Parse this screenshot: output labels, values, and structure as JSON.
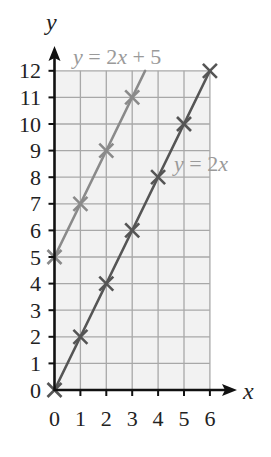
{
  "chart_data": {
    "type": "line",
    "title": "",
    "xlabel": "x",
    "ylabel": "y",
    "xlim": [
      0,
      6
    ],
    "ylim": [
      0,
      12
    ],
    "grid": true,
    "x_ticks": [
      0,
      1,
      2,
      3,
      4,
      5,
      6
    ],
    "y_ticks": [
      0,
      1,
      2,
      3,
      4,
      5,
      6,
      7,
      8,
      9,
      10,
      11,
      12
    ],
    "series": [
      {
        "name": "y = 2x + 5",
        "equation": "y = 2x + 5",
        "color": "#8a8a8a",
        "marker": "x",
        "points": [
          [
            0,
            5
          ],
          [
            1,
            7
          ],
          [
            2,
            9
          ],
          [
            3,
            11
          ]
        ],
        "line_extent": [
          [
            0,
            5
          ],
          [
            3.5,
            12
          ]
        ]
      },
      {
        "name": "y = 2x",
        "equation": "y = 2x",
        "color": "#555555",
        "marker": "x",
        "points": [
          [
            0,
            0
          ],
          [
            1,
            2
          ],
          [
            2,
            4
          ],
          [
            3,
            6
          ],
          [
            4,
            8
          ],
          [
            5,
            10
          ],
          [
            6,
            12
          ]
        ],
        "line_extent": [
          [
            0,
            0
          ],
          [
            6,
            12
          ]
        ]
      }
    ],
    "annotations": [
      {
        "text_parts": [
          "y",
          " = 2",
          "x",
          " + 5"
        ],
        "italic": [
          true,
          false,
          true,
          false
        ],
        "x_px": 73,
        "y_px": 64
      },
      {
        "text_parts": [
          "y",
          " = 2",
          "x"
        ],
        "italic": [
          true,
          false,
          true
        ],
        "x_px": 174,
        "y_px": 171
      }
    ]
  },
  "colors": {
    "grid_background": "#f2f2f2",
    "grid_line": "#a8a8a8",
    "axis": "#111111"
  }
}
